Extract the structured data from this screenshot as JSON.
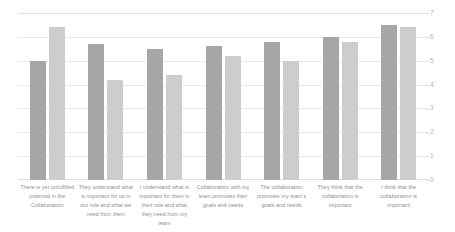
{
  "chart_data": {
    "type": "bar",
    "title": "",
    "subtitle": "",
    "xlabel": "",
    "ylabel": "",
    "ylim": [
      0,
      7
    ],
    "yticks": [
      7,
      6,
      5,
      4,
      3,
      2,
      1,
      0
    ],
    "grid": true,
    "legend": false,
    "legend_position": "none",
    "categories": [
      "There is yet unfulfilled potential in the Collaboration",
      "They understand what is important for us in our role and what we need from them",
      "I understand what is important for them in their role and what they need from my team",
      "Collaboration with my team promotes their goals and needs",
      "The collaboration promotes my team's goals and needs",
      "They think that the collaboration is important",
      "I think that the collaboration is important"
    ],
    "series": [
      {
        "name": "Series 1",
        "color": "#a6a6a6",
        "values": [
          5.0,
          5.7,
          5.5,
          5.6,
          5.8,
          6.0,
          6.5
        ]
      },
      {
        "name": "Series 2",
        "color": "#cdcdcd",
        "values": [
          6.4,
          4.2,
          4.4,
          5.2,
          5.0,
          5.8,
          6.4
        ]
      }
    ]
  },
  "axis": {
    "tick_color": "#b2b2b2",
    "grid_color": "#e9e9e9"
  }
}
